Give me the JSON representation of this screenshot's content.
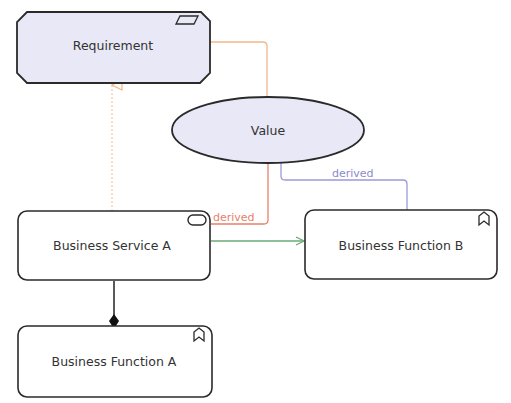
{
  "diagram": {
    "nodes": {
      "requirement": {
        "label": "Requirement",
        "type": "requirement",
        "fill": "#e8e8f6"
      },
      "value": {
        "label": "Value",
        "type": "value",
        "fill": "#e8e8f6"
      },
      "business_service_a": {
        "label": "Business Service A",
        "type": "business-service",
        "fill": "#ffffff"
      },
      "business_function_a": {
        "label": "Business Function A",
        "type": "business-function",
        "fill": "#ffffff"
      },
      "business_function_b": {
        "label": "Business Function B",
        "type": "business-function",
        "fill": "#ffffff"
      }
    },
    "edges": {
      "requirement_value": {
        "from": "Requirement",
        "to": "Value",
        "type": "association",
        "color": "#f0b88a",
        "label": ""
      },
      "service_realizes_requirement": {
        "from": "Business Service A",
        "to": "Requirement",
        "type": "realization",
        "color": "#f0b88a",
        "label": ""
      },
      "value_service_derived": {
        "from": "Value",
        "to": "Business Service A",
        "type": "association",
        "color": "#e8806a",
        "label": "derived"
      },
      "value_function_b_derived": {
        "from": "Value",
        "to": "Business Function B",
        "type": "association",
        "color": "#9a9ad8",
        "label": "derived"
      },
      "service_to_function_b": {
        "from": "Business Service A",
        "to": "Business Function B",
        "type": "triggering",
        "color": "#6aaa7a",
        "label": ""
      },
      "service_composes_function_a": {
        "from": "Business Service A",
        "to": "Business Function A",
        "type": "composition",
        "color": "#222222",
        "label": ""
      }
    }
  }
}
